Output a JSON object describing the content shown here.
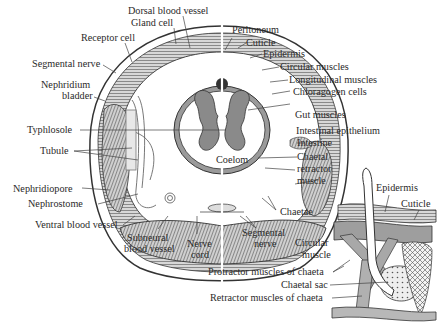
{
  "figure": {
    "main_section_labels": {
      "dorsal_blood_vessel": "Dorsal blood vessel",
      "gland_cell": "Gland cell",
      "receptor_cell": "Receptor cell",
      "segmental_nerve_top": "Segmental nerve",
      "nephridium_bladder_line1": "Nephridium",
      "nephridium_bladder_line2": "bladder",
      "typhlosole": "Typhlosole",
      "tubule": "Tubule",
      "nephridiopore": "Nephridiopore",
      "nephrostome": "Nephrostome",
      "ventral_blood_vessel": "Ventral blood vessel",
      "subneural_line1": "Subneural",
      "subneural_line2": "blood vessel",
      "nerve_cord_line1": "Nerve",
      "nerve_cord_line2": "cord",
      "segmental_nerve_bottom_line1": "Segmental",
      "segmental_nerve_bottom_line2": "nerve",
      "peritoneum": "Peritoneum",
      "cuticle": "Cuticle",
      "epidermis": "Epidermis",
      "circular_muscles": "Circular muscles",
      "longitudinal_muscles": "Longitudinal muscles",
      "chloragogen_cells": "Chloragogen cells",
      "gut_muscles": "Gut muscles",
      "intestinal_epithelium": "Intestinal epithelium",
      "intestine": "Intestine",
      "coelom": "Coelom",
      "chaetal_retractor_line1": "Chaetal",
      "chaetal_retractor_line2": "retractor",
      "chaetal_retractor_line3": "muscle",
      "chaetae": "Chaetae"
    },
    "chaeta_detail_labels": {
      "epidermis": "Epidermis",
      "cuticle": "Cuticle",
      "circular_muscle_line1": "Circular",
      "circular_muscle_line2": "muscle",
      "protractor_muscles": "Protractor muscles of chaeta",
      "chaetal_sac": "Chaetal sac",
      "retractor_muscles": "Retractor muscles of chaeta"
    }
  }
}
